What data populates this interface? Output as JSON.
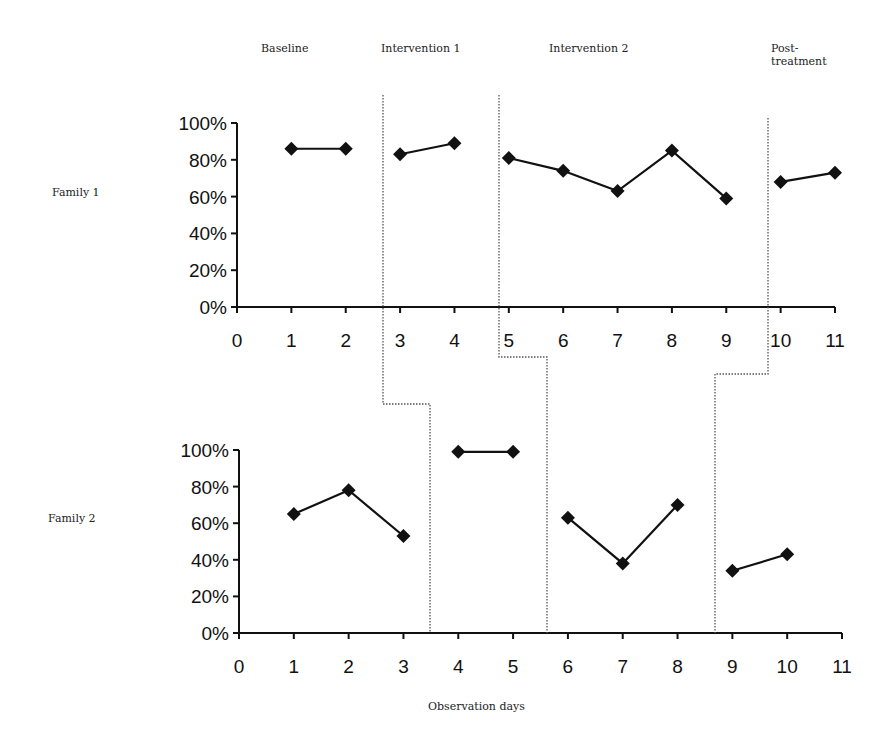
{
  "chart_data": {
    "type": "line",
    "title": "",
    "xlabel": "Observation days",
    "ylabel": "",
    "phases": [
      "Baseline",
      "Intervention 1",
      "Intervention 2",
      "Post-treatment"
    ],
    "panels": [
      {
        "name": "Family 1",
        "x_ticks": [
          0,
          1,
          2,
          3,
          4,
          5,
          6,
          7,
          8,
          9,
          10,
          11
        ],
        "y_ticks": [
          "0%",
          "20%",
          "40%",
          "60%",
          "80%",
          "100%"
        ],
        "ylim": [
          0,
          100
        ],
        "xlim": [
          0,
          11
        ],
        "segments": [
          {
            "phase": "Baseline",
            "x": [
              1,
              2
            ],
            "y": [
              86,
              86
            ]
          },
          {
            "phase": "Intervention 1",
            "x": [
              3,
              4
            ],
            "y": [
              83,
              89
            ]
          },
          {
            "phase": "Intervention 2",
            "x": [
              5,
              6,
              7,
              8,
              9
            ],
            "y": [
              81,
              74,
              63,
              85,
              59
            ]
          },
          {
            "phase": "Post-treatment",
            "x": [
              10,
              11
            ],
            "y": [
              68,
              73
            ]
          }
        ]
      },
      {
        "name": "Family 2",
        "x_ticks": [
          0,
          1,
          2,
          3,
          4,
          5,
          6,
          7,
          8,
          9,
          10,
          11
        ],
        "y_ticks": [
          "0%",
          "20%",
          "40%",
          "60%",
          "80%",
          "100%"
        ],
        "ylim": [
          0,
          100
        ],
        "xlim": [
          0,
          11
        ],
        "segments": [
          {
            "phase": "Baseline",
            "x": [
              1,
              2,
              3
            ],
            "y": [
              65,
              78,
              53
            ]
          },
          {
            "phase": "Intervention 1",
            "x": [
              4,
              5
            ],
            "y": [
              99,
              99
            ]
          },
          {
            "phase": "Intervention 2",
            "x": [
              6,
              7,
              8
            ],
            "y": [
              63,
              38,
              70
            ]
          },
          {
            "phase": "Post-treatment",
            "x": [
              9,
              10
            ],
            "y": [
              34,
              43
            ]
          }
        ]
      }
    ],
    "phase_change_lines": [
      {
        "family1_between": [
          2,
          3
        ],
        "family2_between": [
          3,
          4
        ]
      },
      {
        "family1_between": [
          4,
          5
        ],
        "family2_between": [
          5,
          6
        ]
      },
      {
        "family1_between": [
          9,
          10
        ],
        "family2_between": [
          8,
          9
        ]
      }
    ],
    "marker": "diamond",
    "line_color": "#111111",
    "grid": false
  },
  "labels": {
    "phase_baseline": "Baseline",
    "phase_int1": "Intervention 1",
    "phase_int2": "Intervention 2",
    "phase_post_1": "Post-",
    "phase_post_2": "treatment",
    "family1": "Family 1",
    "family2": "Family 2",
    "xlabel": "Observation days"
  }
}
